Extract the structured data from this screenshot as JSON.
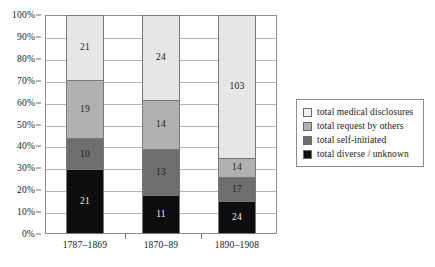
{
  "chart_data": {
    "type": "bar",
    "stacked": true,
    "normalized": "percent",
    "title": "",
    "xlabel": "",
    "ylabel": "",
    "ylim": [
      0,
      100
    ],
    "grid": true,
    "legend_position": "right",
    "categories": [
      "1787–1869",
      "1870–89",
      "1890–1908"
    ],
    "ytick_labels": [
      "100%",
      "90%",
      "80%",
      "70%",
      "60%",
      "50%",
      "40%",
      "30%",
      "20%",
      "10%",
      "0%"
    ],
    "ytick_values": [
      100,
      90,
      80,
      70,
      60,
      50,
      40,
      30,
      20,
      10,
      0
    ],
    "series": [
      {
        "name": "total medical disclosures",
        "color": "#e6e6e6",
        "swatch_color": "#f2f2f2",
        "values": [
          21,
          24,
          103
        ],
        "percents": [
          29.6,
          38.7,
          65.2
        ]
      },
      {
        "name": "total request by others",
        "color": "#b1b1b1",
        "swatch_color": "#b1b1b1",
        "values": [
          19,
          14,
          14
        ],
        "percents": [
          26.8,
          22.6,
          8.9
        ]
      },
      {
        "name": "total self-initiated",
        "color": "#6e6e6e",
        "swatch_color": "#6e6e6e",
        "values": [
          10,
          13,
          17
        ],
        "percents": [
          14.1,
          21.0,
          10.8
        ]
      },
      {
        "name": "total diverse / unknown",
        "color": "#0d0d0d",
        "swatch_color": "#0d0d0d",
        "values": [
          21,
          11,
          24
        ],
        "percents": [
          29.6,
          17.7,
          15.2
        ]
      }
    ],
    "column_totals": [
      71,
      62,
      158
    ]
  },
  "legend": {
    "items": [
      {
        "label": "total medical disclosures"
      },
      {
        "label": "total request by others"
      },
      {
        "label": "total self-initiated"
      },
      {
        "label": "total diverse / unknown"
      }
    ]
  }
}
